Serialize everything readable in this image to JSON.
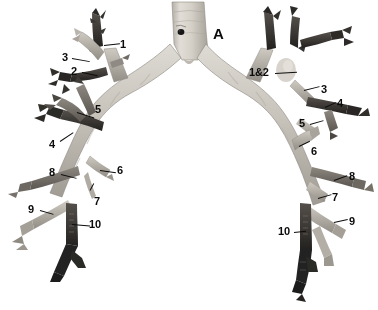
{
  "figure": {
    "background_color": "#ffffff",
    "label_color": "#0b0b0b",
    "specimen_tone_light": "#cfcbc4",
    "specimen_tone_mid": "#9b978f",
    "specimen_tone_dark": "#3a3732",
    "width": 378,
    "height": 310
  },
  "labels": {
    "trachea": {
      "text": "A"
    },
    "left_side": [
      {
        "id": "left-1",
        "text": "1"
      },
      {
        "id": "left-3",
        "text": "3"
      },
      {
        "id": "left-2",
        "text": "2"
      },
      {
        "id": "left-5",
        "text": "5"
      },
      {
        "id": "left-4",
        "text": "4"
      },
      {
        "id": "left-8",
        "text": "8"
      },
      {
        "id": "left-6",
        "text": "6"
      },
      {
        "id": "left-7",
        "text": "7"
      },
      {
        "id": "left-9",
        "text": "9"
      },
      {
        "id": "left-10",
        "text": "10"
      }
    ],
    "right_side": [
      {
        "id": "right-1and2",
        "text": "1&2"
      },
      {
        "id": "right-3",
        "text": "3"
      },
      {
        "id": "right-4",
        "text": "4"
      },
      {
        "id": "right-5",
        "text": "5"
      },
      {
        "id": "right-6",
        "text": "6"
      },
      {
        "id": "right-8",
        "text": "8"
      },
      {
        "id": "right-7",
        "text": "7"
      },
      {
        "id": "right-9",
        "text": "9"
      },
      {
        "id": "right-10",
        "text": "10"
      }
    ]
  }
}
